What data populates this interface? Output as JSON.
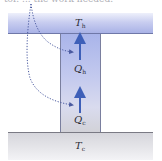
{
  "caption": "tor. ... the work needed.",
  "diagram": {
    "hot_reservoir": {
      "symbol": "T",
      "subscript": "h",
      "color": "#a9b2e6"
    },
    "cold_reservoir": {
      "symbol": "T",
      "subscript": "c",
      "color": "#d6d6dc"
    },
    "heat_hot": {
      "symbol": "Q",
      "subscript": "h"
    },
    "heat_cold": {
      "symbol": "Q",
      "subscript": "c"
    },
    "arrow_color": "#3e5fb8",
    "dotted_line_color": "#4a5aa0"
  }
}
